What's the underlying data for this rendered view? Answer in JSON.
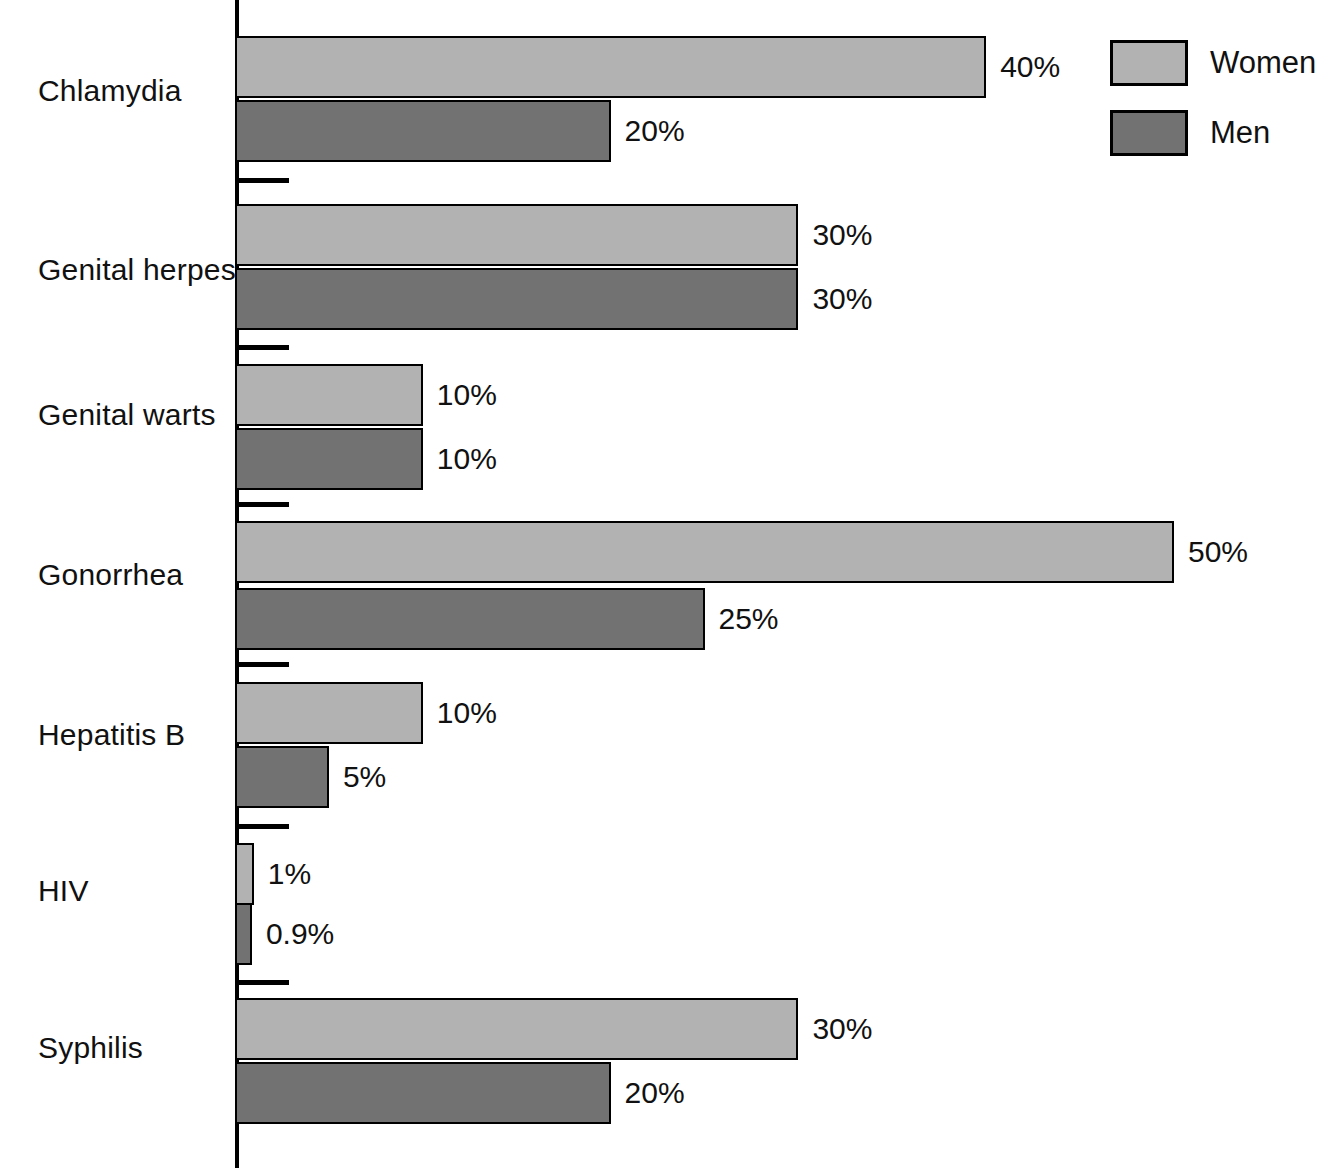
{
  "chart_data": {
    "type": "bar",
    "orientation": "horizontal",
    "title": "",
    "xlabel": "",
    "ylabel": "",
    "categories": [
      "Chlamydia",
      "Genital herpes",
      "Genital warts",
      "Gonorrhea",
      "Hepatitis B",
      "HIV",
      "Syphilis"
    ],
    "series": [
      {
        "name": "Women",
        "color": "#b2b2b2",
        "values": [
          40,
          30,
          10,
          50,
          10,
          1,
          30
        ],
        "labels": [
          "40%",
          "30%",
          "10%",
          "50%",
          "10%",
          "1%",
          "30%"
        ]
      },
      {
        "name": "Men",
        "color": "#727272",
        "values": [
          20,
          30,
          10,
          25,
          5,
          0.9,
          20
        ],
        "labels": [
          "20%",
          "30%",
          "10%",
          "25%",
          "5%",
          "0.9%",
          "20%"
        ]
      }
    ],
    "xlim": [
      0,
      50
    ],
    "grid": false,
    "legend_position": "top-right",
    "value_label_suffix": "%"
  },
  "legend": {
    "entries": [
      {
        "label": "Women",
        "color": "#b2b2b2"
      },
      {
        "label": "Men",
        "color": "#727272"
      }
    ]
  },
  "axis": {
    "line_color": "#000000",
    "bar_border_color": "#000000"
  },
  "top_fragment": ""
}
